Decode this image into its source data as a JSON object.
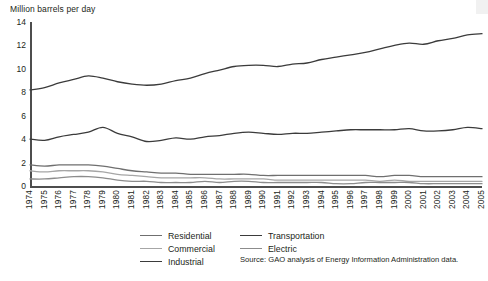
{
  "chart_data": {
    "type": "line",
    "title": "Million barrels per day",
    "xlabel": "",
    "ylabel": "Million barrels per day",
    "ylim": [
      0,
      14
    ],
    "yticks": [
      0,
      2,
      4,
      6,
      8,
      10,
      12,
      14
    ],
    "grid": false,
    "legend_position": "bottom",
    "x": [
      1974,
      1975,
      1976,
      1977,
      1978,
      1979,
      1980,
      1981,
      1982,
      1983,
      1984,
      1985,
      1986,
      1987,
      1988,
      1989,
      1990,
      1991,
      1992,
      1993,
      1994,
      1995,
      1996,
      1997,
      1998,
      1999,
      2000,
      2001,
      2002,
      2003,
      2004,
      2005
    ],
    "series": [
      {
        "name": "Transportation",
        "color": "#3b3b3b",
        "values": [
          8.2,
          8.4,
          8.8,
          9.1,
          9.4,
          9.2,
          8.9,
          8.7,
          8.6,
          8.7,
          9.0,
          9.2,
          9.6,
          9.9,
          10.2,
          10.3,
          10.3,
          10.2,
          10.4,
          10.5,
          10.8,
          11.0,
          11.2,
          11.4,
          11.7,
          12.0,
          12.2,
          12.1,
          12.4,
          12.6,
          12.9,
          13.0
        ]
      },
      {
        "name": "Industrial",
        "color": "#3b3b3b",
        "values": [
          4.0,
          3.9,
          4.2,
          4.4,
          4.6,
          5.0,
          4.5,
          4.2,
          3.8,
          3.9,
          4.1,
          4.0,
          4.2,
          4.3,
          4.5,
          4.6,
          4.5,
          4.4,
          4.5,
          4.5,
          4.6,
          4.7,
          4.8,
          4.8,
          4.8,
          4.8,
          4.9,
          4.7,
          4.7,
          4.8,
          5.0,
          4.9
        ]
      },
      {
        "name": "Residential",
        "color": "#6f6f6f",
        "values": [
          1.8,
          1.7,
          1.8,
          1.8,
          1.8,
          1.7,
          1.5,
          1.3,
          1.2,
          1.1,
          1.1,
          1.0,
          1.0,
          1.0,
          1.0,
          1.0,
          0.9,
          0.9,
          0.9,
          0.9,
          0.9,
          0.9,
          0.9,
          0.9,
          0.8,
          0.9,
          0.9,
          0.8,
          0.8,
          0.8,
          0.8,
          0.8
        ]
      },
      {
        "name": "Commercial",
        "color": "#a6a6a6",
        "values": [
          1.3,
          1.2,
          1.3,
          1.3,
          1.3,
          1.2,
          1.0,
          0.9,
          0.8,
          0.7,
          0.7,
          0.7,
          0.7,
          0.6,
          0.6,
          0.6,
          0.6,
          0.5,
          0.5,
          0.5,
          0.5,
          0.5,
          0.5,
          0.5,
          0.4,
          0.5,
          0.4,
          0.4,
          0.4,
          0.4,
          0.4,
          0.4
        ]
      },
      {
        "name": "Electric",
        "color": "#8c8c8c",
        "values": [
          0.6,
          0.6,
          0.7,
          0.8,
          0.8,
          0.7,
          0.5,
          0.4,
          0.4,
          0.3,
          0.3,
          0.3,
          0.4,
          0.3,
          0.4,
          0.4,
          0.3,
          0.3,
          0.3,
          0.3,
          0.3,
          0.2,
          0.2,
          0.3,
          0.3,
          0.3,
          0.3,
          0.2,
          0.2,
          0.2,
          0.2,
          0.2
        ]
      }
    ],
    "source": "Source: GAO analysis of Energy Information Administration data."
  },
  "axis": {
    "title": "Million barrels per day",
    "yticks": [
      "14",
      "12",
      "10",
      "8",
      "6",
      "4",
      "2",
      "0"
    ],
    "xticks": [
      "1974",
      "1975",
      "1976",
      "1977",
      "1978",
      "1979",
      "1980",
      "1981",
      "1982",
      "1983",
      "1984",
      "1985",
      "1986",
      "1987",
      "1988",
      "1989",
      "1990",
      "1991",
      "1992",
      "1993",
      "1994",
      "1995",
      "1996",
      "1997",
      "1998",
      "1999",
      "2000",
      "2001",
      "2002",
      "2003",
      "2004",
      "2005"
    ]
  },
  "legend": {
    "left_column": [
      {
        "label": "Residential",
        "color": "#6f6f6f"
      },
      {
        "label": "Commercial",
        "color": "#a6a6a6"
      },
      {
        "label": "Industrial",
        "color": "#3b3b3b"
      }
    ],
    "right_column": [
      {
        "label": "Transportation",
        "color": "#3b3b3b"
      },
      {
        "label": "Electric",
        "color": "#8c8c8c"
      }
    ]
  },
  "source_note": "Source: GAO analysis of Energy Information Administration data."
}
